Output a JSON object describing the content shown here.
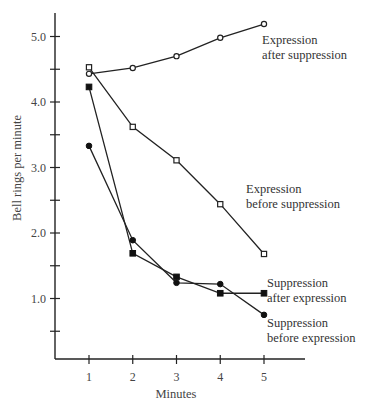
{
  "chart_data": {
    "type": "line",
    "title": "",
    "xlabel": "Minutes",
    "ylabel": "Bell rings per minute",
    "x": [
      1,
      2,
      3,
      4,
      5
    ],
    "x_tick_labels": [
      "1",
      "2",
      "3",
      "4",
      "5"
    ],
    "y_tick_labels": [
      "1.0",
      "2.0",
      "3.0",
      "4.0",
      "5.0"
    ],
    "y_minor_ticks": [
      0.5,
      1.5,
      2.5,
      3.5,
      4.5
    ],
    "ylim": [
      0,
      5.3
    ],
    "xlim": [
      0.5,
      5.6
    ],
    "grid": false,
    "legend": "inline labels at right end of each series",
    "series": [
      {
        "name": "Expression after suppression",
        "label_lines": [
          "Expression",
          "after suppression"
        ],
        "marker": "open-circle",
        "values": [
          4.43,
          4.52,
          4.7,
          4.98,
          5.19
        ]
      },
      {
        "name": "Expression before suppression",
        "label_lines": [
          "Expression",
          "before suppression"
        ],
        "marker": "open-square",
        "values": [
          4.53,
          3.62,
          3.11,
          2.44,
          1.68
        ]
      },
      {
        "name": "Suppression after expression",
        "label_lines": [
          "Suppression",
          "after expression"
        ],
        "marker": "filled-square",
        "values": [
          4.23,
          1.69,
          1.33,
          1.08,
          1.08
        ]
      },
      {
        "name": "Suppression before expression",
        "label_lines": [
          "Suppression",
          "before expression"
        ],
        "marker": "filled-circle",
        "values": [
          3.33,
          1.89,
          1.24,
          1.22,
          0.75
        ]
      }
    ]
  }
}
